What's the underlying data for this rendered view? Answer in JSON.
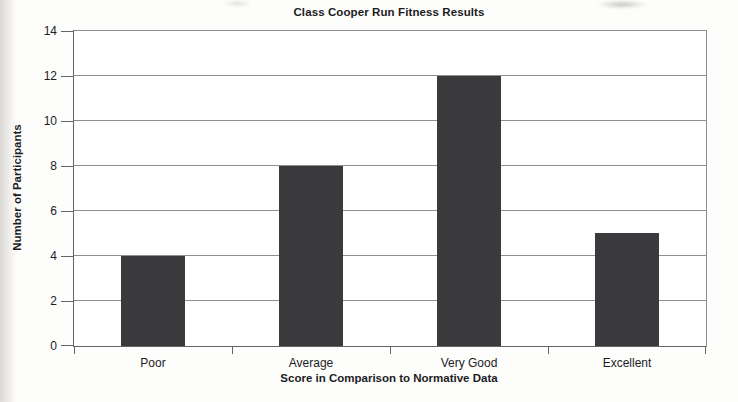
{
  "chart_data": {
    "type": "bar",
    "title": "Class Cooper Run Fitness Results",
    "categories": [
      "Poor",
      "Average",
      "Very Good",
      "Excellent"
    ],
    "values": [
      4,
      8,
      12,
      5
    ],
    "xlabel": "Score in Comparison to Normative Data",
    "ylabel": "Number of Participants",
    "ylim": [
      0,
      14
    ],
    "yticks": [
      0,
      2,
      4,
      6,
      8,
      10,
      12,
      14
    ],
    "grid": "horizontal",
    "legend": "none",
    "bar_color": "#3a3a3c",
    "gridline_color": "#8e8e8e",
    "axis_color": "#646466"
  }
}
